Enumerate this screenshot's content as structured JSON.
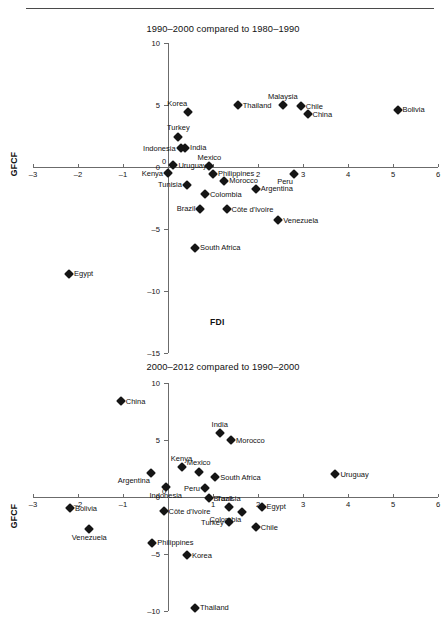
{
  "page": {
    "axis_x_name": "FDI",
    "axis_y_name": "GFCF"
  },
  "chart_data": [
    {
      "type": "scatter",
      "title": "1990–2000 compared to 1980–1990",
      "xlabel": "FDI",
      "ylabel": "GFCF",
      "xlim": [
        -3,
        6
      ],
      "ylim": [
        -15,
        10
      ],
      "xticks": [
        -3,
        -2,
        -1,
        0,
        1,
        2,
        3,
        4,
        5,
        6
      ],
      "xtick_labels": [
        "–3",
        "–2",
        "–1",
        "0",
        "1",
        "2",
        "3",
        "4",
        "5",
        "6"
      ],
      "yticks": [
        10,
        5,
        0,
        -5,
        -10,
        -15
      ],
      "ytick_labels": [
        "10",
        "5",
        "0",
        "–5",
        "–10",
        "–15"
      ],
      "grid": false,
      "legend": "none",
      "points": [
        {
          "label": "Korea",
          "x": 0.45,
          "y": 4.45,
          "pos": "topleft"
        },
        {
          "label": "Thailand",
          "x": 1.55,
          "y": 5.0,
          "pos": "right"
        },
        {
          "label": "Malaysia",
          "x": 2.55,
          "y": 5.0,
          "pos": "top"
        },
        {
          "label": "Chile",
          "x": 2.95,
          "y": 4.9,
          "pos": "right"
        },
        {
          "label": "China",
          "x": 3.1,
          "y": 4.25,
          "pos": "right"
        },
        {
          "label": "Bolivia",
          "x": 5.1,
          "y": 4.6,
          "pos": "right"
        },
        {
          "label": "Turkey",
          "x": 0.23,
          "y": 2.45,
          "pos": "top"
        },
        {
          "label": "India",
          "x": 0.38,
          "y": 1.55,
          "pos": "right"
        },
        {
          "label": "Indonesia",
          "x": 0.28,
          "y": 1.5,
          "pos": "left"
        },
        {
          "label": "Uruguay",
          "x": 0.12,
          "y": 0.15,
          "pos": "right"
        },
        {
          "label": "Mexico",
          "x": 0.92,
          "y": 0.05,
          "pos": "top"
        },
        {
          "label": "Kenya",
          "x": 0.0,
          "y": -0.5,
          "pos": "left"
        },
        {
          "label": "Philippines",
          "x": 1.0,
          "y": -0.55,
          "pos": "right"
        },
        {
          "label": "Peru",
          "x": 2.8,
          "y": -0.6,
          "pos": "botleft"
        },
        {
          "label": "Morocco",
          "x": 1.25,
          "y": -1.1,
          "pos": "right"
        },
        {
          "label": "Tunisia",
          "x": 0.42,
          "y": -1.45,
          "pos": "left"
        },
        {
          "label": "Argentina",
          "x": 1.95,
          "y": -1.75,
          "pos": "right"
        },
        {
          "label": "Colombia",
          "x": 0.82,
          "y": -2.2,
          "pos": "right"
        },
        {
          "label": "Brazil",
          "x": 0.72,
          "y": -3.35,
          "pos": "left"
        },
        {
          "label": "Côte d'Ivoire",
          "x": 1.3,
          "y": -3.4,
          "pos": "right"
        },
        {
          "label": "Venezuela",
          "x": 2.45,
          "y": -4.3,
          "pos": "right"
        },
        {
          "label": "South Africa",
          "x": 0.6,
          "y": -6.5,
          "pos": "right"
        },
        {
          "label": "Egypt",
          "x": -2.2,
          "y": -8.6,
          "pos": "right"
        }
      ]
    },
    {
      "type": "scatter",
      "title": "2000–2012 compared to 1990–2000",
      "xlabel": "FDI",
      "ylabel": "GFCF",
      "xlim": [
        -3,
        6
      ],
      "ylim": [
        -10,
        10
      ],
      "xticks": [
        -3,
        -2,
        -1,
        0,
        1,
        2,
        3,
        4,
        5,
        6
      ],
      "xtick_labels": [
        "–3",
        "–2",
        "–1",
        "0",
        "1",
        "2",
        "3",
        "4",
        "5",
        "6"
      ],
      "yticks": [
        10,
        5,
        0,
        -5,
        -10
      ],
      "ytick_labels": [
        "10",
        "5",
        "0",
        "–5",
        "–10"
      ],
      "grid": false,
      "legend": "none",
      "points": [
        {
          "label": "China",
          "x": -1.05,
          "y": 8.4,
          "pos": "right"
        },
        {
          "label": "India",
          "x": 1.15,
          "y": 5.6,
          "pos": "top"
        },
        {
          "label": "Morocco",
          "x": 1.4,
          "y": 5.0,
          "pos": "right"
        },
        {
          "label": "Kenya",
          "x": 0.3,
          "y": 2.6,
          "pos": "top"
        },
        {
          "label": "Mexico",
          "x": 0.68,
          "y": 2.2,
          "pos": "top"
        },
        {
          "label": "Uruguay",
          "x": 3.72,
          "y": 2.0,
          "pos": "right"
        },
        {
          "label": "Argentina",
          "x": -0.38,
          "y": 2.1,
          "pos": "botleft"
        },
        {
          "label": "South Africa",
          "x": 1.05,
          "y": 1.75,
          "pos": "right"
        },
        {
          "label": "Indonesia",
          "x": -0.05,
          "y": 0.9,
          "pos": "bottom"
        },
        {
          "label": "Peru",
          "x": 0.82,
          "y": 0.75,
          "pos": "left"
        },
        {
          "label": "Brazil",
          "x": 0.9,
          "y": -0.1,
          "pos": "right"
        },
        {
          "label": "Tunisia",
          "x": 1.35,
          "y": -0.9,
          "pos": "top"
        },
        {
          "label": "Egypt",
          "x": 2.08,
          "y": -0.85,
          "pos": "right"
        },
        {
          "label": "Bolivia",
          "x": -2.18,
          "y": -1.0,
          "pos": "right"
        },
        {
          "label": "Côte d'Ivoire",
          "x": -0.1,
          "y": -1.25,
          "pos": "right"
        },
        {
          "label": "Colombia",
          "x": 1.65,
          "y": -1.35,
          "pos": "botleft"
        },
        {
          "label": "Turkey",
          "x": 1.35,
          "y": -2.2,
          "pos": "left"
        },
        {
          "label": "Chile",
          "x": 1.95,
          "y": -2.65,
          "pos": "right"
        },
        {
          "label": "Venezuela",
          "x": -1.75,
          "y": -2.85,
          "pos": "bottom"
        },
        {
          "label": "Philippines",
          "x": -0.35,
          "y": -4.0,
          "pos": "right"
        },
        {
          "label": "Korea",
          "x": 0.42,
          "y": -5.1,
          "pos": "right"
        },
        {
          "label": "Thailand",
          "x": 0.6,
          "y": -9.7,
          "pos": "right"
        }
      ]
    }
  ]
}
